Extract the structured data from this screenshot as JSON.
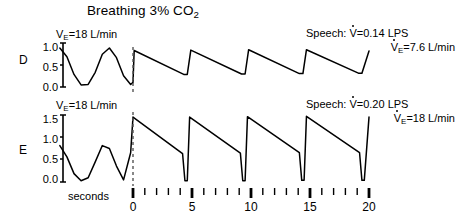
{
  "figure": {
    "title_prefix": "Breathing 3% CO",
    "title_sub": "2",
    "title_full": "Breathing 3% CO2",
    "background_color": "#ffffff",
    "trace_color": "#000000"
  },
  "panels": [
    {
      "letter": "D",
      "baseline_label_prefix": "V",
      "baseline_label_sub": "E",
      "baseline_label_rest": "=18 L/min",
      "baseline_label_full": "VE=18 L/min",
      "speech_line1_prefix": "Speech: ",
      "speech_line1_v": "V",
      "speech_line1_rest": "=0.14 LPS",
      "speech_line1_full": "Speech: V=0.14 LPS",
      "speech_line2_v": "V",
      "speech_line2_sub": "E",
      "speech_line2_rest": "=7.6 L/min",
      "speech_line2_full": "VE=7.6 L/min",
      "y_ticks": [
        "1.0",
        "0.5",
        "0.0"
      ]
    },
    {
      "letter": "E",
      "baseline_label_prefix": "V",
      "baseline_label_sub": "E",
      "baseline_label_rest": "=18 L/min",
      "baseline_label_full": "VE=18 L/min",
      "speech_line1_prefix": "Speech: ",
      "speech_line1_v": "V",
      "speech_line1_rest": "=0.20 LPS",
      "speech_line1_full": "Speech: V=0.20 LPS",
      "speech_line2_v": "V",
      "speech_line2_sub": "E",
      "speech_line2_rest": "=18 L/min",
      "speech_line2_full": "VE=18 L/min",
      "y_ticks": [
        "1.5",
        "1.0",
        "0.5",
        "0.0"
      ]
    }
  ],
  "x_axis": {
    "label": "seconds",
    "major_ticks": [
      "0",
      "5",
      "10",
      "15",
      "20"
    ],
    "minor_ticks_per_interval": 4,
    "range": [
      -1,
      21
    ]
  },
  "chart_data": {
    "type": "line",
    "title": "Breathing 3% CO2",
    "xlabel": "seconds",
    "ylabel": "",
    "xlim": [
      -6.2,
      20.4
    ],
    "grid": false,
    "legend": "none",
    "panels": [
      {
        "name": "D",
        "ylim": [
          0.0,
          1.05
        ],
        "yticks": [
          0.0,
          0.5,
          1.0
        ],
        "annotations": {
          "pre_speech": "VE=18 L/min",
          "speech_flow": "Speech: V=0.14 LPS",
          "speech_ventilation": "VE=7.6 L/min"
        },
        "series": [
          {
            "name": "quiet-breathing",
            "x": [
              -6.2,
              -5.6,
              -5.0,
              -4.4,
              -3.8,
              -3.2,
              -2.6,
              -2.0,
              -1.4,
              -0.8,
              -0.2,
              0.0
            ],
            "y": [
              0.93,
              0.72,
              0.3,
              0.05,
              0.06,
              0.35,
              0.78,
              0.93,
              0.7,
              0.27,
              0.06,
              0.11
            ]
          },
          {
            "name": "speech-breathing",
            "x": [
              0.0,
              0.1,
              4.3,
              4.6,
              4.9,
              9.2,
              9.5,
              9.8,
              14.1,
              14.4,
              14.7,
              19.1,
              19.4,
              20.0
            ],
            "y": [
              0.11,
              0.87,
              0.3,
              0.3,
              0.88,
              0.31,
              0.31,
              0.89,
              0.32,
              0.32,
              0.89,
              0.33,
              0.33,
              0.86
            ]
          }
        ]
      },
      {
        "name": "E",
        "ylim": [
          0.0,
          1.6
        ],
        "yticks": [
          0.0,
          0.5,
          1.0,
          1.5
        ],
        "annotations": {
          "pre_speech": "VE=18 L/min",
          "speech_flow": "Speech: V=0.20 LPS",
          "speech_ventilation": "VE=18 L/min"
        },
        "series": [
          {
            "name": "quiet-breathing",
            "x": [
              -6.2,
              -5.6,
              -5.0,
              -4.4,
              -3.8,
              -3.2,
              -2.6,
              -2.0,
              -1.4,
              -0.8,
              -0.2,
              0.0
            ],
            "y": [
              0.87,
              0.6,
              0.2,
              0.03,
              0.1,
              0.48,
              0.87,
              0.8,
              0.38,
              0.05,
              0.7,
              1.55
            ]
          },
          {
            "name": "speech-breathing",
            "x": [
              0.0,
              4.2,
              4.4,
              4.6,
              4.8,
              9.1,
              9.3,
              9.5,
              9.7,
              14.1,
              14.3,
              14.5,
              14.7,
              19.2,
              19.4,
              19.6,
              20.0
            ],
            "y": [
              1.55,
              0.68,
              0.03,
              0.03,
              1.55,
              0.69,
              0.03,
              0.03,
              1.56,
              0.7,
              0.04,
              0.04,
              1.57,
              0.7,
              0.04,
              0.04,
              1.55
            ]
          }
        ]
      }
    ]
  }
}
